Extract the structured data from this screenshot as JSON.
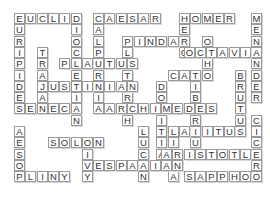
{
  "puzzle": {
    "type": "crossword-fill-in",
    "cell_px": 11.3,
    "origin": [
      14,
      13
    ],
    "words": [
      {
        "word": "EUCLID",
        "dir": "across",
        "row": 0,
        "col": 0
      },
      {
        "word": "CAESAR",
        "dir": "across",
        "row": 0,
        "col": 7
      },
      {
        "word": "HOMER",
        "dir": "across",
        "row": 0,
        "col": 14.6
      },
      {
        "word": "MENANDER",
        "dir": "down",
        "row": 0,
        "col": 21
      },
      {
        "word": "EURIPIDES",
        "dir": "down",
        "row": 0,
        "col": 0
      },
      {
        "word": "DIOCLETIAN",
        "dir": "down",
        "row": 0,
        "col": 5
      },
      {
        "word": "CALPURNIA",
        "dir": "down",
        "row": 0,
        "col": 7
      },
      {
        "word": "HERO",
        "dir": "down",
        "row": 0,
        "col": 14.6
      },
      {
        "word": "PINDAR",
        "dir": "across",
        "row": 2,
        "col": 9.6
      },
      {
        "word": "PLUTARCH",
        "dir": "down",
        "row": 2,
        "col": 9.6
      },
      {
        "word": "OTHO",
        "dir": "down",
        "row": 2,
        "col": 16.6
      },
      {
        "word": "OCTAVIA",
        "dir": "across",
        "row": 3,
        "col": 15
      },
      {
        "word": "TRAJAN",
        "dir": "down",
        "row": 3,
        "col": 2
      },
      {
        "word": "PLAUTUS",
        "dir": "across",
        "row": 4,
        "col": 4
      },
      {
        "word": "CATO",
        "dir": "across",
        "row": 5,
        "col": 13.6
      },
      {
        "word": "BRUTUS",
        "dir": "down",
        "row": 5,
        "col": 19.6
      },
      {
        "word": "TIBERIUS",
        "dir": "down",
        "row": 5,
        "col": 15.6
      },
      {
        "word": "JUSTINIAN",
        "dir": "across",
        "row": 6,
        "col": 2
      },
      {
        "word": "DOMITIAN",
        "dir": "down",
        "row": 6,
        "col": 12.6
      },
      {
        "word": "SENECA",
        "dir": "across",
        "row": 8,
        "col": 0
      },
      {
        "word": "ARCHIMEDES",
        "dir": "across",
        "row": 8,
        "col": 8
      },
      {
        "word": "CICERO",
        "dir": "down",
        "row": 9,
        "col": 21
      },
      {
        "word": "AESOP",
        "dir": "down",
        "row": 10,
        "col": 0
      },
      {
        "word": "LUCAN",
        "dir": "down",
        "row": 10,
        "col": 11
      },
      {
        "word": "LIVIA",
        "dir": "down",
        "row": 10,
        "col": 13.6
      },
      {
        "word": "TACITUS",
        "dir": "across",
        "row": 10,
        "col": 13.6
      },
      {
        "word": "SOLON",
        "dir": "across",
        "row": 11,
        "col": 3
      },
      {
        "word": "LIVY",
        "dir": "down",
        "row": 11,
        "col": 6
      },
      {
        "word": "ARISTOTLE",
        "dir": "across",
        "row": 12,
        "col": 13
      },
      {
        "word": "VESPASIAN",
        "dir": "across",
        "row": 13,
        "col": 6
      },
      {
        "word": "PLINY",
        "dir": "across",
        "row": 14,
        "col": 0
      },
      {
        "word": "SAPPHO",
        "dir": "across",
        "row": 14,
        "col": 15
      }
    ]
  },
  "colors": {
    "cell_border": "#9a9a9a",
    "letter": "#333333",
    "background": "#ffffff"
  }
}
